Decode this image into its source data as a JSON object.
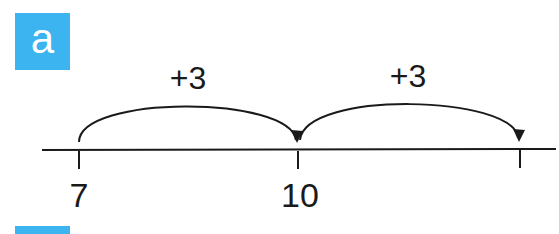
{
  "badge": {
    "label": "a",
    "color": "#3bb4ef"
  },
  "number_line": {
    "ticks": [
      {
        "value_label": "7",
        "x": 79
      },
      {
        "value_label": "10",
        "x": 298
      },
      {
        "value_label": "",
        "x": 520
      }
    ],
    "jumps": [
      {
        "label": "+3",
        "from": "7",
        "to": "10",
        "x": 188
      },
      {
        "label": "+3",
        "from": "10",
        "to": "13",
        "x": 410
      }
    ]
  }
}
